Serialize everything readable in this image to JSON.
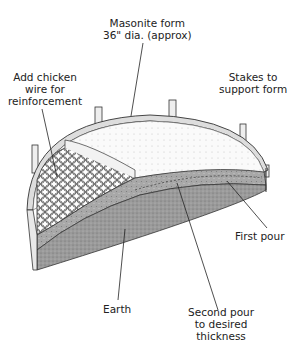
{
  "diagram": {
    "labels": {
      "masonite_form": [
        "Masonite form",
        "36\" dia. (approx)"
      ],
      "chicken_wire": [
        "Add chicken",
        "wire for",
        "reinforcement"
      ],
      "stakes": [
        "Stakes to",
        "support form"
      ],
      "first_pour": [
        "First pour"
      ],
      "earth": [
        "Earth"
      ],
      "second_pour": [
        "Second pour",
        "to desired",
        "thickness"
      ]
    }
  }
}
